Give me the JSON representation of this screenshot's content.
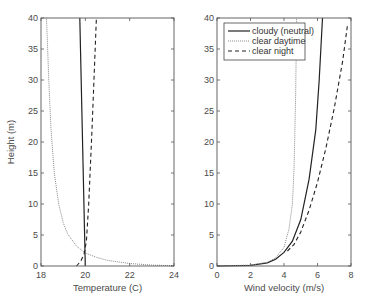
{
  "chart_data": [
    {
      "type": "line",
      "title": "",
      "xlabel": "Temperature (C)",
      "ylabel": "Height (m)",
      "xlim": [
        18,
        24
      ],
      "ylim": [
        0,
        40
      ],
      "xticks": [
        18,
        20,
        22,
        24
      ],
      "yticks": [
        0,
        5,
        10,
        15,
        20,
        25,
        30,
        35,
        40
      ],
      "grid": false,
      "series": [
        {
          "name": "cloudy (neutral)",
          "style": "solid",
          "color": "#222222",
          "x": [
            20.0,
            19.75
          ],
          "y": [
            0,
            40
          ]
        },
        {
          "name": "clear daytime",
          "style": "dotted",
          "color": "#8a8a8a",
          "x": [
            24.0,
            23.0,
            22.0,
            21.0,
            20.5,
            20.0,
            19.6,
            19.2,
            19.0,
            18.8,
            18.6,
            18.45,
            18.35,
            18.25
          ],
          "y": [
            0.05,
            0.15,
            0.4,
            0.9,
            1.4,
            2.1,
            3.2,
            5.2,
            7.0,
            10.0,
            15.0,
            22.0,
            30.0,
            40.0
          ]
        },
        {
          "name": "clear night",
          "style": "dashed",
          "color": "#222222",
          "x": [
            19.6,
            19.8,
            19.95,
            20.05,
            20.15,
            20.3,
            20.5
          ],
          "y": [
            0,
            0.8,
            2.0,
            4.0,
            10.0,
            22.0,
            40.0
          ]
        }
      ]
    },
    {
      "type": "line",
      "title": "",
      "xlabel": "Wind velocity (m/s)",
      "ylabel": "",
      "xlim": [
        0,
        8
      ],
      "ylim": [
        0,
        40
      ],
      "xticks": [
        0,
        2,
        4,
        6,
        8
      ],
      "yticks": [
        0,
        5,
        10,
        15,
        20,
        25,
        30,
        35,
        40
      ],
      "grid": false,
      "legend": {
        "position": "top-left",
        "entries": [
          "cloudy (neutral)",
          "clear daytime",
          "clear night"
        ]
      },
      "series": [
        {
          "name": "cloudy (neutral)",
          "style": "solid",
          "color": "#222222",
          "x": [
            0,
            2.0,
            3.0,
            3.5,
            4.0,
            4.5,
            5.0,
            5.5,
            5.9,
            6.1,
            6.3
          ],
          "y": [
            0,
            0.1,
            0.5,
            1.1,
            2.2,
            4.0,
            7.5,
            14.0,
            22.0,
            30.0,
            40.0
          ]
        },
        {
          "name": "clear daytime",
          "style": "dotted",
          "color": "#8a8a8a",
          "x": [
            0,
            2.0,
            3.0,
            3.5,
            4.0,
            4.3,
            4.5,
            4.6,
            4.7,
            4.75
          ],
          "y": [
            0,
            0.15,
            0.6,
            1.3,
            3.0,
            6.0,
            10.0,
            16.0,
            28.0,
            40.0
          ]
        },
        {
          "name": "clear night",
          "style": "dashed",
          "color": "#222222",
          "x": [
            4.2,
            4.6,
            5.0,
            5.5,
            6.0,
            6.5,
            7.0,
            7.5,
            7.8
          ],
          "y": [
            2.4,
            3.5,
            5.5,
            9.0,
            13.5,
            19.0,
            25.5,
            33.0,
            39.0
          ]
        }
      ]
    }
  ]
}
